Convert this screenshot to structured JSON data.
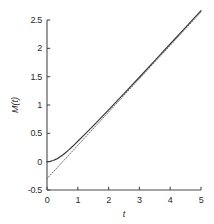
{
  "chart_data": {
    "type": "line",
    "title": "",
    "xlabel": "t",
    "ylabel": "M(t)",
    "xlim": [
      0,
      5
    ],
    "ylim": [
      -0.5,
      2.5
    ],
    "grid": false,
    "legend": null,
    "xticks": [
      "0",
      "1",
      "2",
      "3",
      "4",
      "5"
    ],
    "xtick_values": [
      0,
      1,
      2,
      3,
      4,
      5
    ],
    "yticks": [
      "-0.5",
      "0",
      "0.5",
      "1",
      "1.5",
      "2",
      "2.5"
    ],
    "ytick_values": [
      -0.5,
      0,
      0.5,
      1,
      1.5,
      2,
      2.5
    ],
    "series": [
      {
        "name": "M(t)",
        "style": "solid",
        "color": "#3a3a3a",
        "x": [
          0,
          0.1,
          0.2,
          0.3,
          0.4,
          0.5,
          0.6,
          0.7,
          0.8,
          0.9,
          1,
          1.25,
          1.5,
          1.75,
          2,
          2.5,
          3,
          3.5,
          4,
          4.5,
          5
        ],
        "y": [
          0,
          0.005,
          0.02,
          0.044,
          0.076,
          0.114,
          0.157,
          0.204,
          0.254,
          0.306,
          0.36,
          0.494,
          0.632,
          0.772,
          0.914,
          1.2,
          1.49,
          1.783,
          2.076,
          2.37,
          2.664
        ]
      },
      {
        "name": "asymptote",
        "style": "dotted",
        "color": "#6b6b6b",
        "x": [
          0,
          5
        ],
        "y": [
          -0.3,
          2.64
        ],
        "intercept": -0.3,
        "slope": 0.588
      }
    ],
    "annotations": []
  },
  "axes": {
    "y_axis_name": "y-axis-spine",
    "x_axis_name": "x-axis-spine"
  }
}
